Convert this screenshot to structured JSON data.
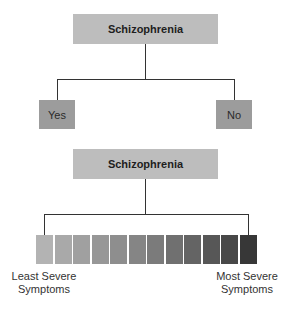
{
  "diagram_top": {
    "root_label": "Schizophrenia",
    "branches": [
      {
        "label": "Yes"
      },
      {
        "label": "No"
      }
    ]
  },
  "diagram_bottom": {
    "root_label": "Schizophrenia",
    "scale": {
      "segment_count": 12,
      "colors": [
        "#b3b3b3",
        "#a9a9a9",
        "#a0a0a0",
        "#979797",
        "#8e8e8e",
        "#858585",
        "#7b7b7b",
        "#707070",
        "#646464",
        "#575757",
        "#484848",
        "#373737"
      ],
      "left_label_line1": "Least Severe",
      "left_label_line2": "Symptoms",
      "right_label_line1": "Most Severe",
      "right_label_line2": "Symptoms"
    }
  },
  "colors": {
    "root_fill": "#bdbdbd",
    "leaf_fill": "#9c9c9c",
    "line": "#333333"
  }
}
